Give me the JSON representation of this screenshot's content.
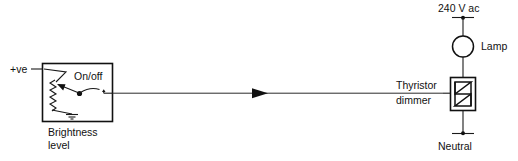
{
  "diagram": {
    "type": "schematic",
    "background_color": "#ffffff",
    "line_color": "#111111"
  },
  "labels": {
    "positive_supply": "+ve",
    "on_off": "On/off",
    "brightness_line1": "Brightness",
    "brightness_line2": "level",
    "mains_supply": "240 V ac",
    "lamp": "Lamp",
    "thyristor_line1": "Thyristor",
    "thyristor_line2": "dimmer",
    "neutral": "Neutral"
  },
  "components": [
    {
      "id": "brightness-control-block",
      "name": "Brightness level control",
      "symbol": "potentiometer-with-switch",
      "caption": "Brightness level"
    },
    {
      "id": "potentiometer",
      "name": "Variable resistor (potentiometer)",
      "symbol": "zigzag-resistor-with-wiper"
    },
    {
      "id": "on-off-switch",
      "name": "On/off switch",
      "symbol": "spst-switch",
      "label": "On/off"
    },
    {
      "id": "ground",
      "name": "Ground / 0V reference",
      "symbol": "earth-ground"
    },
    {
      "id": "lamp",
      "name": "Lamp",
      "symbol": "circle-lamp",
      "label": "Lamp"
    },
    {
      "id": "thyristor-dimmer",
      "name": "Thyristor dimmer",
      "symbol": "triac-in-box",
      "label": "Thyristor dimmer"
    },
    {
      "id": "mains-terminal",
      "name": "240 V ac supply terminal",
      "symbol": "terminal-bar",
      "label": "240 V ac"
    },
    {
      "id": "neutral-terminal",
      "name": "Neutral terminal",
      "symbol": "terminal-bar",
      "label": "Neutral"
    },
    {
      "id": "signal-wire",
      "name": "Control signal wire",
      "symbol": "arrow-right"
    }
  ]
}
